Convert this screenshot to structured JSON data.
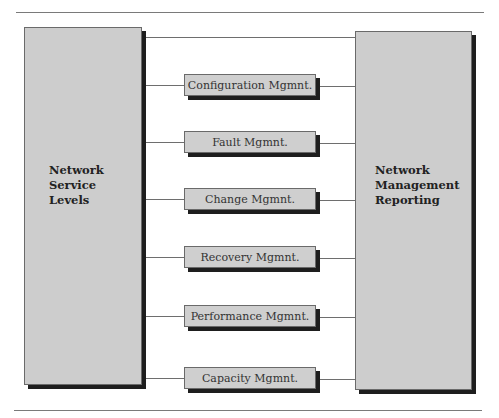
{
  "diagram": {
    "left_box": {
      "lines": [
        "Network",
        "Service",
        "Levels"
      ]
    },
    "right_box": {
      "lines": [
        "Network",
        "Management",
        "Reporting"
      ]
    },
    "functions": [
      {
        "label": "Configuration Mgmnt."
      },
      {
        "label": "Fault Mgmnt."
      },
      {
        "label": "Change Mgmnt."
      },
      {
        "label": "Recovery Mgmnt."
      },
      {
        "label": "Performance Mgmnt."
      },
      {
        "label": "Capacity Mgmnt."
      }
    ],
    "colors": {
      "box_fill": "#cdcdcd",
      "shadow": "#1e1e1e",
      "line": "#6e6e6e"
    }
  }
}
